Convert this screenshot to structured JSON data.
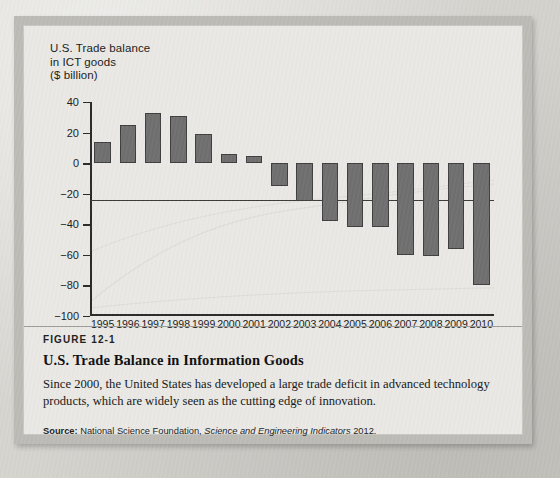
{
  "figure": {
    "number_label": "FIGURE 12-1",
    "title": "U.S. Trade Balance in Information Goods",
    "description": "Since 2000, the United States has developed a large trade deficit in advanced technology products, which are widely seen as the cutting edge of innovation.",
    "source_label": "Source:",
    "source_org": "National Science Foundation,",
    "source_publication": "Science and Engineering Indicators",
    "source_year": "2012."
  },
  "chart_data": {
    "type": "bar",
    "title": "U.S. Trade balance\nin ICT goods\n($ billion)",
    "xlabel": "",
    "ylabel": "$ billion",
    "ylim": [
      -100,
      40
    ],
    "yticks": [
      40,
      20,
      0,
      -20,
      -40,
      -60,
      -80,
      -100
    ],
    "ytick_labels": [
      "40",
      "20",
      "0",
      "−20",
      "−40",
      "−60",
      "−80",
      "−100"
    ],
    "grid": false,
    "legend": "none",
    "bar_color": "#6f6f6f",
    "bar_edge_color": "#3f3f3f",
    "categories": [
      "1995",
      "1996",
      "1997",
      "1998",
      "1999",
      "2000",
      "2001",
      "2002",
      "2003",
      "2004",
      "2005",
      "2006",
      "2007",
      "2008",
      "2009",
      "2010"
    ],
    "values": [
      14,
      25,
      33,
      31,
      19,
      6,
      5,
      -15,
      -25,
      -38,
      -42,
      -42,
      -60,
      -61,
      -56,
      -80
    ]
  }
}
